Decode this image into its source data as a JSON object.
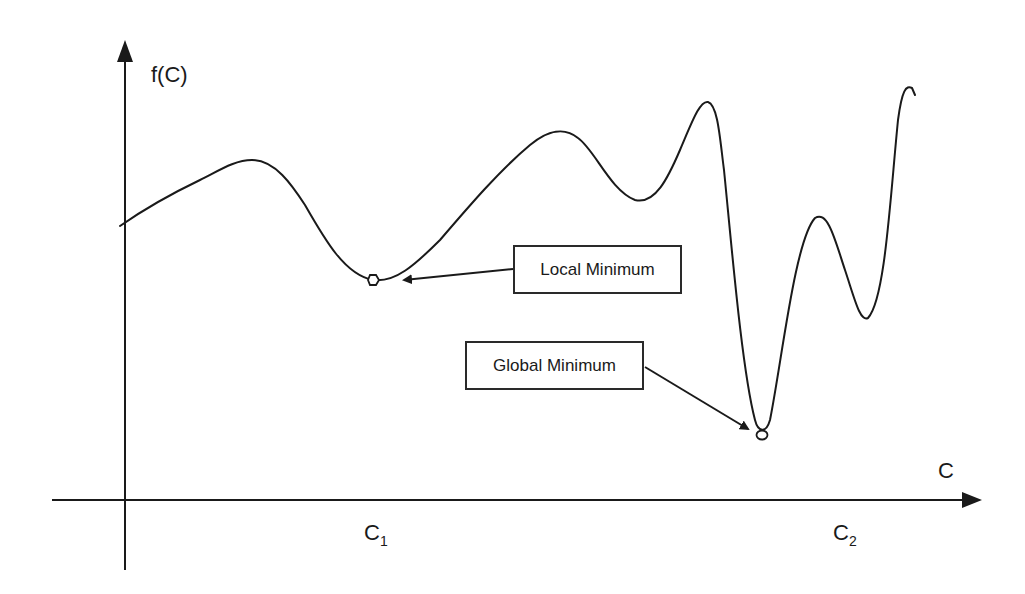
{
  "diagram": {
    "type": "function-landscape",
    "y_axis_label": "f(C)",
    "x_axis_label": "C",
    "ticks": [
      {
        "base": "C",
        "sub": "1"
      },
      {
        "base": "C",
        "sub": "2"
      }
    ],
    "callouts": {
      "local": {
        "label": "Local Minimum"
      },
      "global": {
        "label": "Global Minimum"
      }
    },
    "colors": {
      "line": "#1a1a1a",
      "background": "#ffffff"
    }
  }
}
